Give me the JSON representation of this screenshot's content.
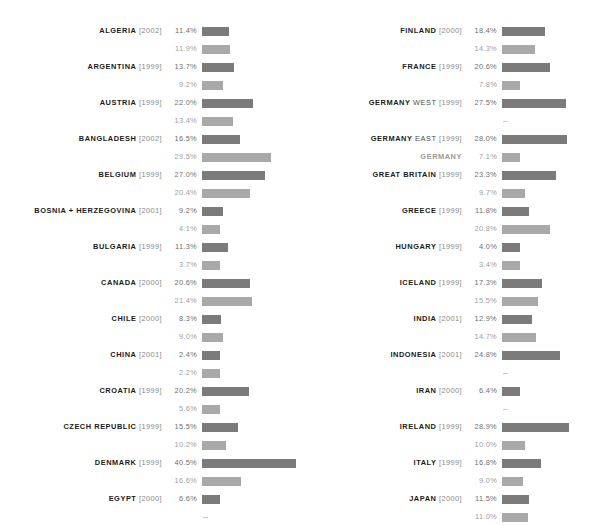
{
  "chart_data": {
    "type": "bar",
    "title": "",
    "xlabel": "",
    "ylabel": "",
    "orientation": "horizontal",
    "value_suffix": "%",
    "max_value": 40.5,
    "grid": false,
    "legend_position": "none",
    "series": [
      {
        "name": "primary",
        "color": "#7b7b7b"
      },
      {
        "name": "secondary",
        "color": "#a9a9a9"
      }
    ],
    "missing_marker": "–",
    "columns": [
      {
        "entries": [
          {
            "country": "ALGERIA",
            "region": "",
            "year": "[2002]",
            "primary_text": "11.4%",
            "primary": 11.4,
            "secondary_text": "11.9%",
            "secondary": 11.9
          },
          {
            "country": "ARGENTINA",
            "region": "",
            "year": "[1999]",
            "primary_text": "13.7%",
            "primary": 13.7,
            "secondary_text": "9.2%",
            "secondary": 9.2
          },
          {
            "country": "AUSTRIA",
            "region": "",
            "year": "[1999]",
            "primary_text": "22.0%",
            "primary": 22.0,
            "secondary_text": "13.4%",
            "secondary": 13.4
          },
          {
            "country": "BANGLADESH",
            "region": "",
            "year": "[2002]",
            "primary_text": "16.5%",
            "primary": 16.5,
            "secondary_text": "29.5%",
            "secondary": 29.5
          },
          {
            "country": "BELGIUM",
            "region": "",
            "year": "[1999]",
            "primary_text": "27.0%",
            "primary": 27.0,
            "secondary_text": "20.4%",
            "secondary": 20.4
          },
          {
            "country": "BOSNIA + HERZEGOVINA",
            "region": "",
            "year": "[2001]",
            "primary_text": "9.2%",
            "primary": 9.2,
            "secondary_text": "4.1%",
            "secondary": 4.1
          },
          {
            "country": "BULGARIA",
            "region": "",
            "year": "[1999]",
            "primary_text": "11.3%",
            "primary": 11.3,
            "secondary_text": "3.7%",
            "secondary": 3.7
          },
          {
            "country": "CANADA",
            "region": "",
            "year": "[2000]",
            "primary_text": "20.6%",
            "primary": 20.6,
            "secondary_text": "21.4%",
            "secondary": 21.4
          },
          {
            "country": "CHILE",
            "region": "",
            "year": "[2000]",
            "primary_text": "8.3%",
            "primary": 8.3,
            "secondary_text": "9.0%",
            "secondary": 9.0
          },
          {
            "country": "CHINA",
            "region": "",
            "year": "[2001]",
            "primary_text": "2.4%",
            "primary": 2.4,
            "secondary_text": "2.2%",
            "secondary": 2.2
          },
          {
            "country": "CROATIA",
            "region": "",
            "year": "[1999]",
            "primary_text": "20.2%",
            "primary": 20.2,
            "secondary_text": "5.6%",
            "secondary": 5.6
          },
          {
            "country": "CZECH REPUBLIC",
            "region": "",
            "year": "[1999]",
            "primary_text": "15.5%",
            "primary": 15.5,
            "secondary_text": "10.2%",
            "secondary": 10.2
          },
          {
            "country": "DENMARK",
            "region": "",
            "year": "[1999]",
            "primary_text": "40.5%",
            "primary": 40.5,
            "secondary_text": "16.6%",
            "secondary": 16.6
          },
          {
            "country": "EGYPT",
            "region": "",
            "year": "[2000]",
            "primary_text": "6.6%",
            "primary": 6.6,
            "secondary_text": "–",
            "secondary": null
          }
        ]
      },
      {
        "entries": [
          {
            "country": "FINLAND",
            "region": "",
            "year": "[2000]",
            "primary_text": "18.4%",
            "primary": 18.4,
            "secondary_text": "14.3%",
            "secondary": 14.3
          },
          {
            "country": "FRANCE",
            "region": "",
            "year": "[1999]",
            "primary_text": "20.6%",
            "primary": 20.6,
            "secondary_text": "7.8%",
            "secondary": 7.8
          },
          {
            "country": "GERMANY",
            "region": "WEST",
            "year": "[1999]",
            "primary_text": "27.5%",
            "primary": 27.5,
            "secondary_text": "–",
            "secondary": null
          },
          {
            "country": "GERMANY",
            "region": "EAST",
            "year": "[1999]",
            "primary_text": "28.0%",
            "primary": 28.0,
            "secondary_text": "7.1%",
            "secondary": 7.1,
            "secondary_label": "GERMANY",
            "secondary_label_style": "soft"
          },
          {
            "country": "GREAT BRITAIN",
            "region": "",
            "year": "[1999]",
            "primary_text": "23.3%",
            "primary": 23.3,
            "secondary_text": "9.7%",
            "secondary": 9.7
          },
          {
            "country": "GREECE",
            "region": "",
            "year": "[1999]",
            "primary_text": "11.8%",
            "primary": 11.8,
            "secondary_text": "20.8%",
            "secondary": 20.8
          },
          {
            "country": "HUNGARY",
            "region": "",
            "year": "[1999]",
            "primary_text": "4.0%",
            "primary": 4.0,
            "secondary_text": "3.4%",
            "secondary": 3.4
          },
          {
            "country": "ICELAND",
            "region": "",
            "year": "[1999]",
            "primary_text": "17.3%",
            "primary": 17.3,
            "secondary_text": "15.5%",
            "secondary": 15.5
          },
          {
            "country": "INDIA",
            "region": "",
            "year": "[2001]",
            "primary_text": "12.9%",
            "primary": 12.9,
            "secondary_text": "14.7%",
            "secondary": 14.7
          },
          {
            "country": "INDONESIA",
            "region": "",
            "year": "[2001]",
            "primary_text": "24.8%",
            "primary": 24.8,
            "secondary_text": "–",
            "secondary": null
          },
          {
            "country": "IRAN",
            "region": "",
            "year": "[2000]",
            "primary_text": "6.4%",
            "primary": 6.4,
            "secondary_text": "–",
            "secondary": null
          },
          {
            "country": "IRELAND",
            "region": "",
            "year": "[1999]",
            "primary_text": "28.9%",
            "primary": 28.9,
            "secondary_text": "10.0%",
            "secondary": 10.0
          },
          {
            "country": "ITALY",
            "region": "",
            "year": "[1999]",
            "primary_text": "16.8%",
            "primary": 16.8,
            "secondary_text": "9.0%",
            "secondary": 9.0
          },
          {
            "country": "JAPAN",
            "region": "",
            "year": "[2000]",
            "primary_text": "11.5%",
            "primary": 11.5,
            "secondary_text": "11.0%",
            "secondary": 11.0
          }
        ]
      }
    ]
  }
}
